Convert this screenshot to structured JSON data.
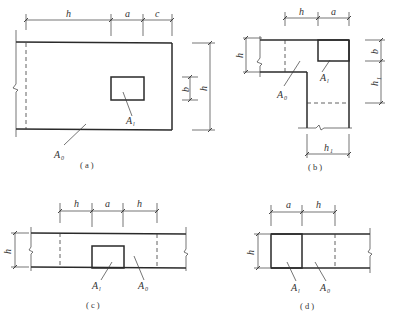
{
  "figures": {
    "a": {
      "caption": "( a )",
      "dims_top": [
        "h",
        "a",
        "c"
      ],
      "dims_right": [
        "b",
        "h"
      ],
      "label_A1": "A",
      "label_A1_sub": "l",
      "label_A0": "A",
      "label_A0_sub": "0"
    },
    "b": {
      "caption": "( b )",
      "dims_top": [
        "h",
        "a"
      ],
      "dim_left": "h",
      "dims_right": [
        "b",
        "h"
      ],
      "dims_right_h1_sub": "1",
      "dim_bottom": "h",
      "dim_bottom_sub": "1",
      "label_A1": "A",
      "label_A1_sub": "l",
      "label_A0": "A",
      "label_A0_sub": "0"
    },
    "c": {
      "caption": "( c )",
      "dims_top": [
        "h",
        "a",
        "h"
      ],
      "dim_left": "h",
      "label_A1": "A",
      "label_A1_sub": "l",
      "label_A0": "A",
      "label_A0_sub": "0"
    },
    "d": {
      "caption": "( d )",
      "dims_top": [
        "a",
        "h"
      ],
      "dim_left": "h",
      "label_A1": "A",
      "label_A1_sub": "l",
      "label_A0": "A",
      "label_A0_sub": "0"
    }
  },
  "colors": {
    "line": "#2a2a2a",
    "background": "#ffffff"
  }
}
